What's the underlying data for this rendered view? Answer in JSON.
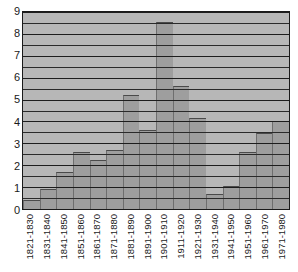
{
  "chart_data": {
    "type": "bar",
    "title": "",
    "subtitle": "",
    "xlabel": "",
    "ylabel": "",
    "ylim": [
      0,
      9
    ],
    "yticks": [
      0,
      1,
      2,
      3,
      4,
      5,
      6,
      7,
      8,
      9
    ],
    "ytick_labels": [
      "0",
      "1",
      "2",
      "3",
      "4",
      "5",
      "6",
      "7",
      "8",
      "9"
    ],
    "grid": "horizontal major and minor (half-unit) lines",
    "legend": "none",
    "legend_position": "none",
    "categories": [
      "1821-1830",
      "1831-1840",
      "1841-1850",
      "1851-1860",
      "1861-1870",
      "1871-1880",
      "1881-1890",
      "1891-1900",
      "1901-1910",
      "1911-1920",
      "1921-1930",
      "1931-1940",
      "1941-1950",
      "1951-1960",
      "1961-1970",
      "1971-1980"
    ],
    "values": [
      0.4,
      0.9,
      1.7,
      2.6,
      2.25,
      2.7,
      5.2,
      3.6,
      8.55,
      5.6,
      4.15,
      0.7,
      1.05,
      2.6,
      3.45,
      4.0
    ],
    "annotations": []
  },
  "colors": {
    "bar_fill": "#9e9e9e",
    "plot_background": "#b7b7b7",
    "gridline": "#1d1d1d",
    "axis_text": "#1a1a1a",
    "page_background": "#ffffff"
  }
}
